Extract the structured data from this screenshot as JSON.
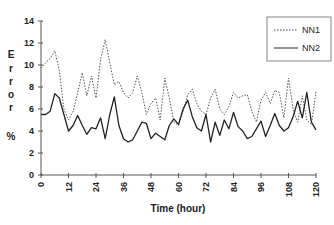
{
  "chart_data": {
    "type": "line",
    "title": "",
    "xlabel": "Time (hour)",
    "ylabel": "Error %",
    "ylabel_letters": [
      "E",
      "r",
      "r",
      "o",
      "r",
      "",
      "%"
    ],
    "xlim": [
      0,
      120
    ],
    "ylim": [
      0,
      14
    ],
    "x_ticks": [
      0,
      12,
      24,
      36,
      48,
      60,
      72,
      84,
      96,
      108,
      120
    ],
    "y_ticks": [
      0,
      2,
      4,
      6,
      8,
      10,
      12,
      14
    ],
    "grid": false,
    "legend_position": "upper right",
    "series": [
      {
        "name": "NN1",
        "style": "dotted",
        "x": [
          0,
          2,
          4,
          6,
          8,
          10,
          12,
          14,
          16,
          18,
          20,
          22,
          24,
          26,
          28,
          30,
          32,
          34,
          36,
          38,
          40,
          42,
          44,
          46,
          48,
          50,
          52,
          54,
          56,
          58,
          60,
          62,
          64,
          66,
          68,
          70,
          72,
          74,
          76,
          78,
          80,
          82,
          84,
          86,
          88,
          90,
          92,
          94,
          96,
          98,
          100,
          102,
          104,
          106,
          108,
          110,
          112,
          114,
          116,
          118,
          120
        ],
        "values": [
          9.7,
          10.2,
          10.6,
          11.3,
          9.5,
          6.0,
          5.0,
          5.8,
          7.5,
          9.3,
          7.2,
          9.0,
          7.0,
          10.5,
          12.3,
          10.2,
          8.2,
          8.5,
          7.5,
          7.0,
          7.5,
          9.0,
          7.5,
          5.5,
          6.5,
          7.0,
          5.0,
          8.8,
          7.0,
          4.8,
          4.5,
          5.8,
          7.3,
          7.8,
          6.5,
          5.8,
          5.5,
          7.0,
          7.8,
          6.0,
          5.5,
          6.2,
          7.5,
          7.0,
          7.2,
          7.3,
          5.8,
          4.8,
          6.8,
          7.5,
          6.5,
          7.7,
          7.5,
          5.2,
          8.8,
          6.0,
          4.8,
          7.2,
          5.0,
          4.6,
          7.6
        ]
      },
      {
        "name": "NN2",
        "style": "solid",
        "x": [
          0,
          2,
          4,
          6,
          8,
          10,
          12,
          14,
          16,
          18,
          20,
          22,
          24,
          26,
          28,
          30,
          32,
          34,
          36,
          38,
          40,
          42,
          44,
          46,
          48,
          50,
          52,
          54,
          56,
          58,
          60,
          62,
          64,
          66,
          68,
          70,
          72,
          74,
          76,
          78,
          80,
          82,
          84,
          86,
          88,
          90,
          92,
          94,
          96,
          98,
          100,
          102,
          104,
          106,
          108,
          110,
          112,
          114,
          116,
          118,
          120
        ],
        "values": [
          5.5,
          5.5,
          5.8,
          7.4,
          7.0,
          5.5,
          4.0,
          4.5,
          5.4,
          4.5,
          3.7,
          4.3,
          4.2,
          5.2,
          3.3,
          5.5,
          7.1,
          4.5,
          3.3,
          3.0,
          3.2,
          4.0,
          4.8,
          4.7,
          3.3,
          3.8,
          3.5,
          3.2,
          4.5,
          5.1,
          4.6,
          6.0,
          6.8,
          5.3,
          4.3,
          4.0,
          5.5,
          3.0,
          4.8,
          3.6,
          5.0,
          4.2,
          5.7,
          4.4,
          4.0,
          3.3,
          3.5,
          4.2,
          4.9,
          3.5,
          4.5,
          5.6,
          4.5,
          4.0,
          4.3,
          5.3,
          6.7,
          5.2,
          7.5,
          4.8,
          4.1
        ]
      }
    ]
  },
  "legend": {
    "items": [
      {
        "label": "NN1",
        "style": "dotted"
      },
      {
        "label": "NN2",
        "style": "solid"
      }
    ]
  },
  "colors": {
    "line": "#222222",
    "axis": "#555555",
    "legend_border": "#555555"
  }
}
